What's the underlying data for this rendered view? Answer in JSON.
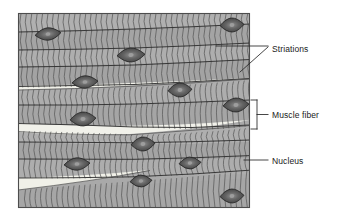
{
  "figure": {
    "kind": "histology-diagram",
    "frame": {
      "x": 18,
      "y": 13,
      "width": 232,
      "height": 195,
      "border_color": "#4a4a4a",
      "fill_color": "#a8a8a8"
    },
    "palette": {
      "background": "#ffffff",
      "tissue_gray": "#a8a8a8",
      "tissue_gray_light": "#b4b4b4",
      "striation_line": "#575757",
      "fiber_boundary": "#3a3a3a",
      "gap_light": "#efefe7",
      "nucleus_fill": "#5a5a5a",
      "nucleus_edge": "#2b2b2b",
      "nucleus_dot": "#9a9a9a",
      "leader_line": "#2b2b2b",
      "text": "#1a1a1a"
    }
  },
  "labels": [
    {
      "id": "striations",
      "text": "Striations",
      "x": 272,
      "y": 44,
      "leader": "two-line-converging-arrow",
      "leader_target_count": 2
    },
    {
      "id": "muscle-fiber",
      "text": "Muscle fiber",
      "x": 272,
      "y": 110,
      "leader": "square-bracket-with-tick",
      "leader_target_count": 1
    },
    {
      "id": "nucleus",
      "text": "Nucleus",
      "x": 272,
      "y": 156,
      "leader": "single-horizontal-line",
      "leader_target_count": 1
    }
  ],
  "structures": {
    "fiber_boundaries_y": [
      13,
      31,
      49,
      66,
      85,
      104,
      122,
      141,
      158,
      176,
      208
    ],
    "light_gaps": [
      {
        "id": "gap-upper",
        "y": 92,
        "note": "wedge between fiber rows 4 and 5"
      },
      {
        "id": "gap-middle",
        "y": 128,
        "note": "wedge between fiber rows 6 and 7"
      },
      {
        "id": "gap-lower",
        "y": 184,
        "note": "wedge near bottom left"
      }
    ],
    "nuclei": [
      {
        "id": "nucleus-1",
        "cx": 48,
        "cy": 34,
        "rx": 13,
        "ry": 6,
        "rot": -6
      },
      {
        "id": "nucleus-2",
        "cx": 232,
        "cy": 25,
        "rx": 12,
        "ry": 7,
        "rot": -3
      },
      {
        "id": "nucleus-3",
        "cx": 131,
        "cy": 55,
        "rx": 14,
        "ry": 7,
        "rot": -3
      },
      {
        "id": "nucleus-4",
        "cx": 85,
        "cy": 82,
        "rx": 13,
        "ry": 6,
        "rot": -4
      },
      {
        "id": "nucleus-5",
        "cx": 180,
        "cy": 90,
        "rx": 12,
        "ry": 7,
        "rot": -4
      },
      {
        "id": "nucleus-6",
        "cx": 236,
        "cy": 105,
        "rx": 13,
        "ry": 7,
        "rot": -4
      },
      {
        "id": "nucleus-7",
        "cx": 83,
        "cy": 119,
        "rx": 13,
        "ry": 7,
        "rot": -4
      },
      {
        "id": "nucleus-8",
        "cx": 143,
        "cy": 144,
        "rx": 12,
        "ry": 7,
        "rot": -4
      },
      {
        "id": "nucleus-9",
        "cx": 77,
        "cy": 164,
        "rx": 13,
        "ry": 6,
        "rot": -4
      },
      {
        "id": "nucleus-10",
        "cx": 190,
        "cy": 163,
        "rx": 11,
        "ry": 6,
        "rot": -4
      },
      {
        "id": "nucleus-11",
        "cx": 141,
        "cy": 181,
        "rx": 11,
        "ry": 6,
        "rot": -4
      },
      {
        "id": "nucleus-12",
        "cx": 232,
        "cy": 196,
        "rx": 12,
        "ry": 7,
        "rot": -3
      }
    ],
    "striation_spacing_px": 5.4,
    "striation_count": 44
  }
}
